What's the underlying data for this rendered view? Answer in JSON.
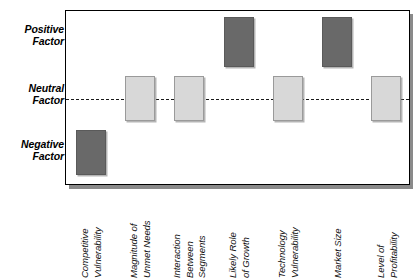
{
  "chart_data": {
    "type": "bar",
    "title": "",
    "subtitle": "",
    "xlabel": "",
    "ylabel": "",
    "grid": false,
    "legend": "none",
    "orientation": "vertical",
    "y_axis": {
      "type": "categorical-ordinal",
      "tick_labels": [
        "Positive\nFactor",
        "Neutral\nFactor",
        "Negative\nFactor"
      ],
      "tick_values": [
        1,
        0,
        -1
      ],
      "ylim": [
        -1.55,
        1.55
      ],
      "reference_line": {
        "value": 0,
        "label": "Neutral Factor",
        "style": "dashed",
        "color": "#1a1a1a"
      }
    },
    "categories": [
      "Competitive\nVulnerability",
      "Magnitude of\nUnmet Needs",
      "Interaction\nBetween\nSegments",
      "Likely Role\nof Growth",
      "Technology\nVulnerability",
      "Market Size",
      "Level of\nProfitability"
    ],
    "values": [
      -1.0,
      0.0,
      0.0,
      1.0,
      0.0,
      1.0,
      0.0
    ],
    "ranges": [
      {
        "low": -1.35,
        "high": -0.55
      },
      {
        "low": -0.4,
        "high": 0.4
      },
      {
        "low": -0.4,
        "high": 0.4
      },
      {
        "low": 0.55,
        "high": 1.45
      },
      {
        "low": -0.4,
        "high": 0.4
      },
      {
        "low": 0.55,
        "high": 1.45
      },
      {
        "low": -0.4,
        "high": 0.4
      }
    ],
    "bar_assessments": [
      "negative",
      "neutral",
      "neutral",
      "positive",
      "neutral",
      "positive",
      "neutral"
    ],
    "bar_colors": [
      "#696969",
      "#d8d8d8",
      "#d8d8d8",
      "#696969",
      "#d8d8d8",
      "#696969",
      "#d8d8d8"
    ],
    "colors": {
      "dark": "#696969",
      "light": "#d8d8d8",
      "frame": "#000000",
      "background": "#ffffff",
      "reference_line": "#1a1a1a",
      "shadow": "#8a8a8a"
    }
  },
  "y_axis_labels": {
    "positive": "Positive\nFactor",
    "neutral": "Neutral\nFactor",
    "negative": "Negative\nFactor"
  },
  "x_axis_labels": [
    "Competitive\nVulnerability",
    "Magnitude of\nUnmet Needs",
    "Interaction\nBetween\nSegments",
    "Likely Role\nof Growth",
    "Technology\nVulnerability",
    "Market Size",
    "Level of\nProfitability"
  ]
}
